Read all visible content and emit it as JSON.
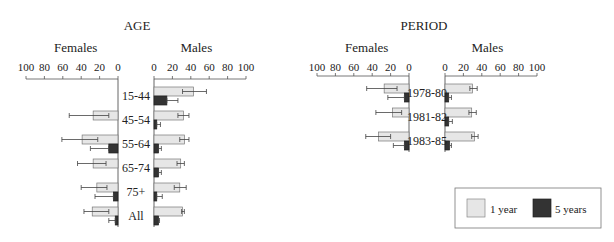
{
  "legend": {
    "items": [
      {
        "label": "1 year",
        "color": "#e6e6e6"
      },
      {
        "label": "5 years",
        "color": "#333333"
      }
    ]
  },
  "chart_data": [
    {
      "type": "bar",
      "title": "AGE",
      "orientation": "horizontal-butterfly",
      "left_label": "Females",
      "right_label": "Males",
      "axis_ticks": [
        0,
        20,
        40,
        60,
        80,
        100
      ],
      "xlim": [
        0,
        100
      ],
      "categories": [
        "15-44",
        "45-54",
        "55-64",
        "65-74",
        "75+",
        "All"
      ],
      "series": [
        {
          "name": "Females 1 year",
          "values": [
            0,
            27,
            39,
            27,
            23,
            28
          ],
          "err_low": [
            0,
            10,
            22,
            13,
            12,
            10
          ],
          "err_high": [
            0,
            53,
            61,
            44,
            40,
            37
          ]
        },
        {
          "name": "Females 5 years",
          "values": [
            0,
            0,
            10,
            0,
            5,
            3
          ],
          "err_low": [
            0,
            0,
            0,
            0,
            0,
            0
          ],
          "err_high": [
            0,
            0,
            30,
            0,
            25,
            10
          ]
        },
        {
          "name": "Males 1 year",
          "values": [
            43,
            32,
            33,
            29,
            28,
            31
          ],
          "err_low": [
            31,
            26,
            28,
            25,
            22,
            30
          ],
          "err_high": [
            57,
            38,
            38,
            33,
            35,
            33
          ]
        },
        {
          "name": "Males 5 years",
          "values": [
            14,
            3,
            5,
            5,
            3,
            5
          ],
          "err_low": [
            3,
            1,
            2,
            2,
            1,
            3
          ],
          "err_high": [
            26,
            7,
            8,
            8,
            9,
            6
          ]
        }
      ]
    },
    {
      "type": "bar",
      "title": "PERIOD",
      "orientation": "horizontal-butterfly",
      "left_label": "Females",
      "right_label": "Males",
      "axis_ticks": [
        0,
        20,
        40,
        60,
        80,
        100
      ],
      "xlim": [
        0,
        100
      ],
      "categories": [
        "1978-80",
        "1981-82",
        "1983-85"
      ],
      "series": [
        {
          "name": "Females 1 year",
          "values": [
            27,
            18,
            33
          ],
          "err_low": [
            13,
            8,
            20
          ],
          "err_high": [
            46,
            36,
            47
          ]
        },
        {
          "name": "Females 5 years",
          "values": [
            5,
            0,
            5
          ],
          "err_low": [
            0,
            0,
            0
          ],
          "err_high": [
            23,
            0,
            17
          ]
        },
        {
          "name": "Males 1 year",
          "values": [
            30,
            29,
            32
          ],
          "err_low": [
            27,
            26,
            29
          ],
          "err_high": [
            35,
            34,
            36
          ]
        },
        {
          "name": "Males 5 years",
          "values": [
            4,
            4,
            5
          ],
          "err_low": [
            2,
            2,
            3
          ],
          "err_high": [
            7,
            8,
            7
          ]
        }
      ]
    }
  ]
}
